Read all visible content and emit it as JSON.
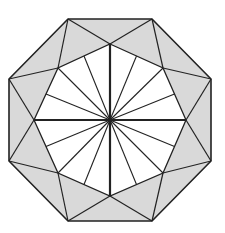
{
  "diagram": {
    "type": "geometric-figure",
    "colors": {
      "background": "#ffffff",
      "ring_fill": "#d9d9d9",
      "inner_fill": "#ffffff",
      "stroke": "#222222"
    },
    "center": [
      110,
      120
    ],
    "outer_octagon": [
      [
        68,
        19
      ],
      [
        152,
        19
      ],
      [
        211,
        79
      ],
      [
        211,
        161
      ],
      [
        152,
        221
      ],
      [
        68,
        221
      ],
      [
        9,
        161
      ],
      [
        9,
        79
      ]
    ],
    "inner_octagon": [
      [
        110,
        44
      ],
      [
        163,
        68
      ],
      [
        186,
        120
      ],
      [
        163,
        173
      ],
      [
        110,
        196
      ],
      [
        58,
        173
      ],
      [
        34,
        120
      ],
      [
        58,
        68
      ]
    ],
    "ray_count": 16
  }
}
